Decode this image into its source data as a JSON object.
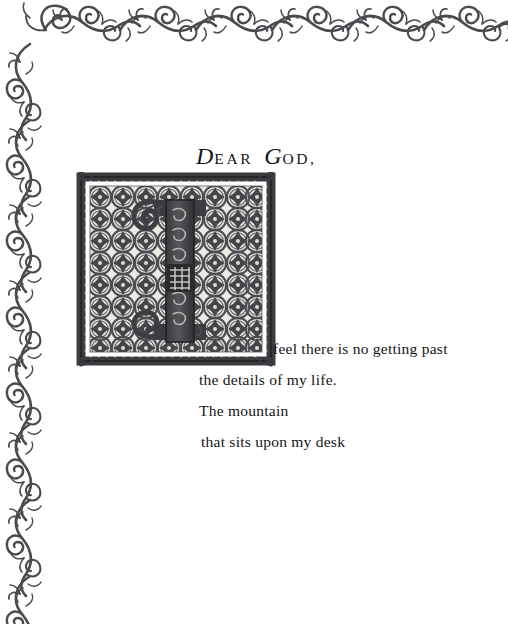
{
  "page": {
    "background_color": "#ffffff",
    "ink_color": "#151515",
    "ornament_color": "#4a4a4f",
    "width": 508,
    "height": 624
  },
  "heading": {
    "initial_d": "D",
    "rest_dear": "EAR",
    "initial_g": "G",
    "rest_god": "OD,",
    "full_text": "DEAR GOD,"
  },
  "illuminated_initial": {
    "letter": "I",
    "description": "ornate square illuminated capital I on a grid of interlocking circular quatrefoil medallions",
    "frame_color": "#3c3c40",
    "panel_color": "#e8e6e1",
    "grid_columns": 8,
    "grid_rows": 8,
    "corner_ornament": "curl-flourish"
  },
  "poem": {
    "lines": [
      "feel there is no getting past",
      "the details of my life.",
      "The mountain",
      "that sits upon my desk"
    ]
  },
  "border": {
    "top_motif": "scrolling-vine-horizontal",
    "left_motif": "scrolling-vine-vertical",
    "corner_motif": "vine-corner-scroll"
  }
}
